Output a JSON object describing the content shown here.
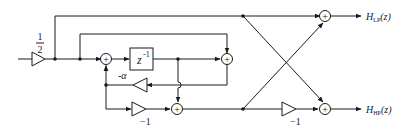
{
  "diagram": {
    "type": "signal-flow block diagram",
    "input_gain": {
      "numerator": "1",
      "denominator": "2"
    },
    "delay": {
      "label": "z",
      "exponent": "-1"
    },
    "feedback_gain": "-α",
    "lower_gain": "−1",
    "output_gain": "−1",
    "adder_symbol": "+",
    "outputs": {
      "lowpass": {
        "H": "H",
        "sub": "LP",
        "arg": "(z)"
      },
      "highpass": {
        "H": "H",
        "sub": "HP",
        "arg": "(z)"
      }
    }
  }
}
